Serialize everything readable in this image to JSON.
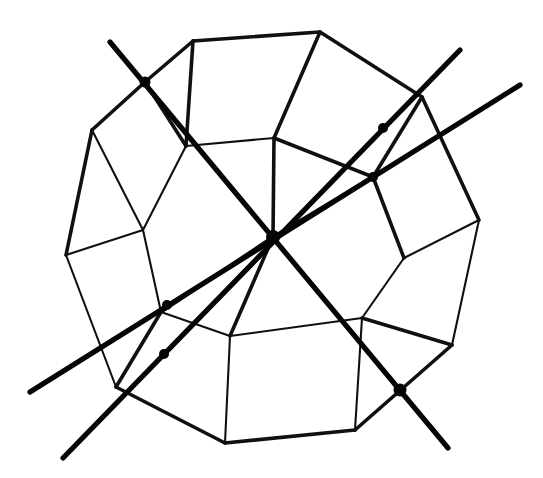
{
  "figure": {
    "title": "Dodecahedron with three 2-fold symmetry axes",
    "caption": "",
    "background_color": "#ffffff",
    "ink_color": "#101010",
    "axis_color": "#050505",
    "canvas": {
      "width": 543,
      "height": 478
    }
  },
  "style": {
    "edge_thin_width": 2.1,
    "edge_thick_width": 3.6,
    "axis_width": 5.2,
    "marker_radius": 5.5
  },
  "chart_data": {
    "type": "diagram",
    "title": "Dodecahedron with three 2-fold symmetry axes",
    "xlabel": "",
    "ylabel": "",
    "vertices": [
      {
        "id": "v1",
        "x": 193,
        "y": 41,
        "label": "top-left-outer"
      },
      {
        "id": "v2",
        "x": 320,
        "y": 32,
        "label": "top-right-outer"
      },
      {
        "id": "v3",
        "x": 422,
        "y": 97,
        "label": "upper-right-outer"
      },
      {
        "id": "v4",
        "x": 479,
        "y": 220,
        "label": "right-outer"
      },
      {
        "id": "v5",
        "x": 452,
        "y": 345,
        "label": "lower-right-outer"
      },
      {
        "id": "v6",
        "x": 355,
        "y": 430,
        "label": "bottom-right-outer"
      },
      {
        "id": "v7",
        "x": 225,
        "y": 443,
        "label": "bottom-left-outer"
      },
      {
        "id": "v8",
        "x": 116,
        "y": 387,
        "label": "lower-left-outer"
      },
      {
        "id": "v9",
        "x": 66,
        "y": 255,
        "label": "left-outer"
      },
      {
        "id": "v10",
        "x": 92,
        "y": 130,
        "label": "upper-left-outer"
      },
      {
        "id": "v11",
        "x": 145,
        "y": 82,
        "label": "top-left-corner"
      },
      {
        "id": "v12",
        "x": 186,
        "y": 146,
        "label": "inner-upper-left"
      },
      {
        "id": "v13",
        "x": 274,
        "y": 138,
        "label": "inner-top"
      },
      {
        "id": "v14",
        "x": 373,
        "y": 177,
        "label": "inner-upper-right"
      },
      {
        "id": "v15",
        "x": 404,
        "y": 258,
        "label": "inner-right"
      },
      {
        "id": "v16",
        "x": 362,
        "y": 318,
        "label": "inner-lower-right"
      },
      {
        "id": "v17",
        "x": 230,
        "y": 336,
        "label": "inner-bottom"
      },
      {
        "id": "v18",
        "x": 161,
        "y": 312,
        "label": "inner-lower-left"
      },
      {
        "id": "v19",
        "x": 143,
        "y": 230,
        "label": "inner-left"
      },
      {
        "id": "v20",
        "x": 273,
        "y": 237,
        "label": "inner-center"
      }
    ],
    "edges": [
      {
        "from": "v1",
        "to": "v2",
        "weight": "thick"
      },
      {
        "from": "v2",
        "to": "v3",
        "weight": "thick"
      },
      {
        "from": "v3",
        "to": "v4",
        "weight": "thick"
      },
      {
        "from": "v4",
        "to": "v5",
        "weight": "thin"
      },
      {
        "from": "v5",
        "to": "v6",
        "weight": "thick"
      },
      {
        "from": "v6",
        "to": "v7",
        "weight": "thick"
      },
      {
        "from": "v7",
        "to": "v8",
        "weight": "thick"
      },
      {
        "from": "v8",
        "to": "v9",
        "weight": "thin"
      },
      {
        "from": "v9",
        "to": "v10",
        "weight": "thick"
      },
      {
        "from": "v10",
        "to": "v11",
        "weight": "thick"
      },
      {
        "from": "v11",
        "to": "v1",
        "weight": "thick"
      },
      {
        "from": "v1",
        "to": "v12",
        "weight": "thick"
      },
      {
        "from": "v11",
        "to": "v12",
        "weight": "thick"
      },
      {
        "from": "v2",
        "to": "v13",
        "weight": "thick"
      },
      {
        "from": "v3",
        "to": "v14",
        "weight": "thick"
      },
      {
        "from": "v4",
        "to": "v15",
        "weight": "thin"
      },
      {
        "from": "v5",
        "to": "v16",
        "weight": "thick"
      },
      {
        "from": "v6",
        "to": "v16",
        "weight": "thin"
      },
      {
        "from": "v7",
        "to": "v17",
        "weight": "thin"
      },
      {
        "from": "v8",
        "to": "v18",
        "weight": "thick"
      },
      {
        "from": "v9",
        "to": "v19",
        "weight": "thin"
      },
      {
        "from": "v10",
        "to": "v19",
        "weight": "thin"
      },
      {
        "from": "v12",
        "to": "v13",
        "weight": "thin"
      },
      {
        "from": "v13",
        "to": "v14",
        "weight": "thick"
      },
      {
        "from": "v14",
        "to": "v15",
        "weight": "thick"
      },
      {
        "from": "v15",
        "to": "v16",
        "weight": "thin"
      },
      {
        "from": "v16",
        "to": "v17",
        "weight": "thin"
      },
      {
        "from": "v17",
        "to": "v18",
        "weight": "thin"
      },
      {
        "from": "v18",
        "to": "v19",
        "weight": "thin"
      },
      {
        "from": "v12",
        "to": "v19",
        "weight": "thin"
      },
      {
        "from": "v13",
        "to": "v20",
        "weight": "thick"
      },
      {
        "from": "v20",
        "to": "v17",
        "weight": "thick"
      },
      {
        "from": "v20",
        "to": "v14",
        "weight": "thick"
      },
      {
        "from": "v20",
        "to": "v18",
        "weight": "thick"
      }
    ],
    "axes": [
      {
        "id": "axis-a",
        "name": "axis-upper-left-to-lower-right",
        "x1": 110,
        "y1": 42,
        "x2": 448,
        "y2": 448,
        "passes_through": [
          "m1",
          "c0",
          "m6"
        ]
      },
      {
        "id": "axis-b",
        "name": "axis-upper-right-to-lower-left",
        "x1": 460,
        "y1": 50,
        "x2": 63,
        "y2": 458,
        "passes_through": [
          "m2",
          "c0",
          "m5"
        ]
      },
      {
        "id": "axis-c",
        "name": "axis-right-to-left",
        "x1": 520,
        "y1": 85,
        "x2": 30,
        "y2": 392,
        "passes_through": [
          "m3",
          "c0",
          "m4"
        ]
      }
    ],
    "markers": [
      {
        "id": "m1",
        "x": 145,
        "y": 82,
        "label": "marker-upper-left",
        "r": 5.5
      },
      {
        "id": "m2",
        "x": 383,
        "y": 128,
        "label": "marker-upper-right",
        "r": 5.0
      },
      {
        "id": "m3",
        "x": 373,
        "y": 177,
        "label": "marker-right-upper",
        "r": 5.0
      },
      {
        "id": "c0",
        "x": 273,
        "y": 237,
        "label": "marker-center",
        "r": 7.0
      },
      {
        "id": "m4",
        "x": 167,
        "y": 305,
        "label": "marker-left-lower",
        "r": 5.0
      },
      {
        "id": "m5",
        "x": 164,
        "y": 354,
        "label": "marker-lower-left",
        "r": 5.0
      },
      {
        "id": "m6",
        "x": 400,
        "y": 390,
        "label": "marker-lower-right",
        "r": 6.5
      }
    ],
    "counts": {
      "vertices": 20,
      "edges": 34,
      "axes": 3,
      "markers": 7
    }
  }
}
